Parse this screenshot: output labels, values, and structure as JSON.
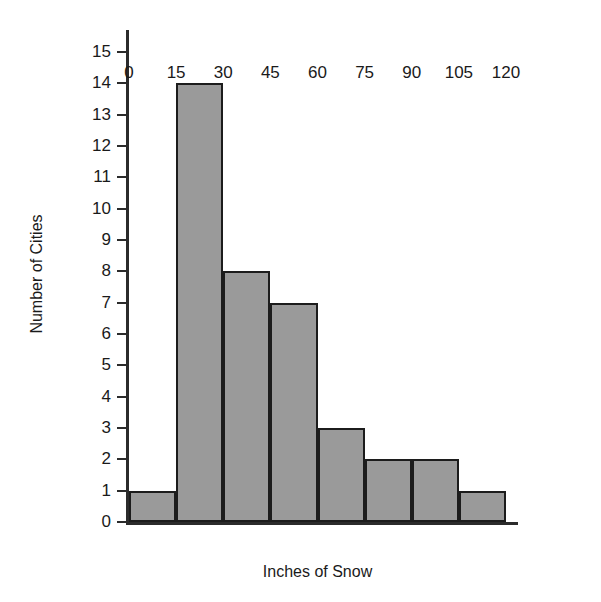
{
  "chart_data": {
    "type": "bar",
    "title": "1000 Snowfall",
    "title_clipped": true,
    "xlabel": "Inches of Snow",
    "ylabel": "Number of Cities",
    "categories": [
      "0-15",
      "15-30",
      "30-45",
      "45-60",
      "60-75",
      "75-90",
      "90-105",
      "105-120"
    ],
    "bin_edges": [
      0,
      15,
      30,
      45,
      60,
      75,
      90,
      105,
      120
    ],
    "values": [
      1,
      14,
      8,
      7,
      3,
      2,
      2,
      1
    ],
    "xlim": [
      0,
      120
    ],
    "ylim": [
      0,
      15
    ],
    "xticks": [
      "0",
      "15",
      "30",
      "45",
      "60",
      "75",
      "90",
      "105",
      "120"
    ],
    "yticks": [
      "0",
      "1",
      "2",
      "3",
      "4",
      "5",
      "6",
      "7",
      "8",
      "9",
      "10",
      "11",
      "12",
      "13",
      "14",
      "15"
    ],
    "grid": false,
    "legend": null,
    "bar_fill_color": "#9a9a9a",
    "bar_edge_color": "#1c1c1c",
    "axis_color": "#2b2b2b",
    "background_color": "#ffffff"
  }
}
